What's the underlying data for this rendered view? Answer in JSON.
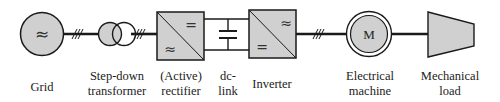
{
  "colors": {
    "fill": "#d0d0d0",
    "stroke": "#1a1a1a",
    "text": "#222222"
  },
  "symbols": {
    "ac": "≈",
    "dc": "=",
    "motor": "M"
  },
  "components": [
    {
      "id": "grid",
      "label_line1": "Grid",
      "label_line2": ""
    },
    {
      "id": "transformer",
      "label_line1": "Step-down",
      "label_line2": "transformer"
    },
    {
      "id": "rectifier",
      "label_line1": "(Active)",
      "label_line2": "rectifier"
    },
    {
      "id": "dc-link",
      "label_line1": "dc-",
      "label_line2": "link"
    },
    {
      "id": "inverter",
      "label_line1": "Inverter",
      "label_line2": ""
    },
    {
      "id": "machine",
      "label_line1": "Electrical",
      "label_line2": "machine"
    },
    {
      "id": "load",
      "label_line1": "Mechanical",
      "label_line2": "load"
    }
  ]
}
